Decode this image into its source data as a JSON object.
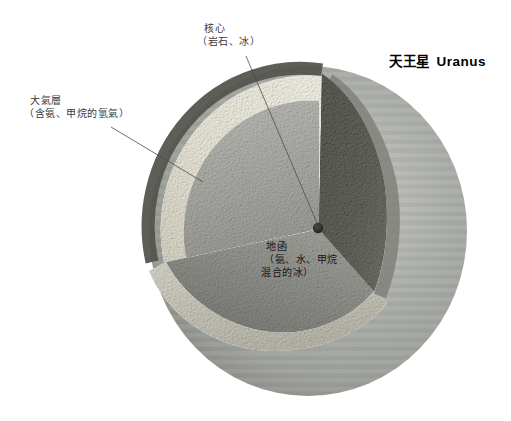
{
  "header": {
    "title_zh": "天王星",
    "title_en": "Uranus"
  },
  "callouts": {
    "core": {
      "title": "核心",
      "subtitle": "（岩石、冰）"
    },
    "atmosphere": {
      "title": "大氣層",
      "subtitle": "（含氨、甲烷的氫氣）"
    },
    "mantle": {
      "title": "地函",
      "subtitle_line1": "（氨、水、甲烷",
      "subtitle_line2": "混合的冰）"
    }
  },
  "colors": {
    "background": "#ffffff",
    "planet_surface": "#a9aba6",
    "planet_limb_shadow": "#74766f",
    "atmosphere_layer": "#efeddf",
    "mantle_cross_section": "#b0b0ab",
    "mantle_dome": "#8e8e8a",
    "cut_face_dark": "#262623",
    "core_dot": "#2c2c27",
    "label_text": "#3a3a3a",
    "title_text": "#000000"
  }
}
